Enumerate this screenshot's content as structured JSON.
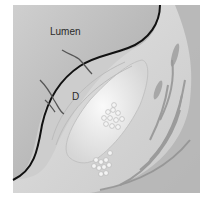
{
  "figure": {
    "labels": {
      "lumen": "Lumen",
      "d": "D"
    },
    "colors": {
      "background": "#ffffff",
      "lumen": "#c4c4c4",
      "lumen_shadow": "#8a8a8a",
      "wall": "#d8d8d8",
      "muscle": "#a9a9a9",
      "muscle_dark": "#8f8f8f",
      "plaque": "#ececec",
      "intima_line": "#111111",
      "outer_rim": "#bdbdbd"
    }
  }
}
